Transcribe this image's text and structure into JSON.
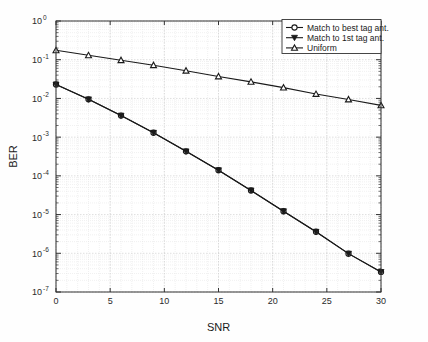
{
  "chart_data": {
    "type": "line",
    "title": "",
    "xlabel": "SNR",
    "ylabel": "BER",
    "yscale": "log",
    "xlim": [
      0,
      30
    ],
    "ylim": [
      1e-07,
      1
    ],
    "xticks": [
      0,
      5,
      10,
      15,
      20,
      25,
      30
    ],
    "xticklabels": [
      "0",
      "5",
      "10",
      "15",
      "20",
      "25",
      "30"
    ],
    "yticklabels": [
      "10^0",
      "10^-1",
      "10^-2",
      "10^-3",
      "10^-4",
      "10^-5",
      "10^-6",
      "10^-7"
    ],
    "ytick_exponents": [
      "0",
      "-1",
      "-2",
      "-3",
      "-4",
      "-5",
      "-6",
      "-7"
    ],
    "grid": true,
    "grid_minor": true,
    "legend_position": "upper right",
    "x": [
      0,
      3,
      6,
      9,
      12,
      15,
      18,
      21,
      24,
      27,
      30
    ],
    "series": [
      {
        "name": "Match to best tag ant.",
        "marker": "circle",
        "color": "#1a1a1a",
        "values": [
          0.023,
          0.0095,
          0.0036,
          0.0013,
          0.00043,
          0.00014,
          4.2e-05,
          1.22e-05,
          3.6e-06,
          9.8e-07,
          3.3e-07
        ]
      },
      {
        "name": "Match to 1st tag ant.",
        "marker": "triangle-down",
        "color": "#1a1a1a",
        "values": [
          0.023,
          0.0095,
          0.0036,
          0.0013,
          0.00043,
          0.00014,
          4.2e-05,
          1.22e-05,
          3.6e-06,
          9.8e-07,
          3.3e-07
        ]
      },
      {
        "name": "Uniform",
        "marker": "triangle-up",
        "color": "#1a1a1a",
        "values": [
          0.175,
          0.13,
          0.097,
          0.072,
          0.052,
          0.037,
          0.0268,
          0.019,
          0.013,
          0.0094,
          0.0066
        ]
      }
    ]
  },
  "legend": {
    "entries": [
      {
        "label": "Match to best tag ant."
      },
      {
        "label": "Match to 1st tag ant."
      },
      {
        "label": "Uniform"
      }
    ]
  },
  "axes": {
    "x_title": "SNR",
    "y_title": "BER"
  },
  "colors": {
    "line": "#1a1a1a",
    "axis": "#333333",
    "grid_major": "#c9c9c9",
    "grid_minor": "#e2e2e2",
    "background": "#fefefe",
    "plot_background": "#ffffff"
  }
}
